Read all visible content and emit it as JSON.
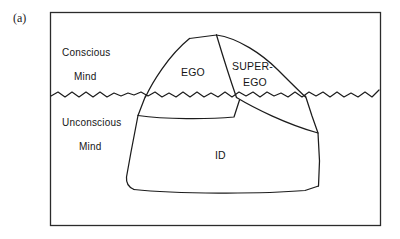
{
  "figure": {
    "panel_label": "(a)",
    "background_color": "#ffffff",
    "line_color": "#1c1c1c",
    "frame_color": "#2b2b2b"
  },
  "zones": [
    {
      "id": "conscious",
      "line1": "Conscious",
      "line2": "Mind",
      "x": 62,
      "y1": 56,
      "y2": 80
    },
    {
      "id": "unconscious",
      "line1": "Unconscious",
      "line2": "Mind",
      "x": 62,
      "y1": 126,
      "y2": 150
    }
  ],
  "structures": [
    {
      "id": "ego",
      "line1": "EGO",
      "line2": "",
      "x": 196,
      "y1": 76,
      "y2": 0
    },
    {
      "id": "superego",
      "line1": "SUPER-",
      "line2": "EGO",
      "x": 263,
      "y1": 70,
      "y2": 86
    },
    {
      "id": "id",
      "line1": "ID",
      "line2": "",
      "x": 222,
      "y1": 159,
      "y2": 0
    }
  ],
  "geometry": {
    "frame": {
      "x": 50,
      "y": 12,
      "width": 331,
      "height": 214
    },
    "waterline_y": 95,
    "peak": {
      "x": 216,
      "y": 35
    }
  },
  "icons": {
    "waterline": "wavy-waterline-icon",
    "iceberg": "iceberg-outline-icon"
  }
}
